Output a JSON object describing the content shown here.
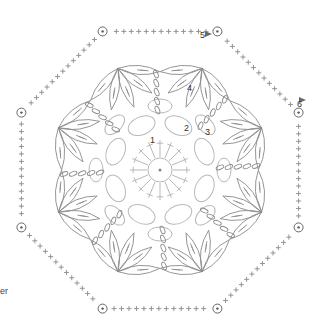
{
  "diagram": {
    "type": "crochet-chart",
    "shape": "octagon",
    "center": [
      160,
      170
    ],
    "line_colors": {
      "inner_rounds": "#b8b8b8",
      "outer_rounds": "#8a8a8a",
      "markers": "#555555",
      "arrow": "#6a6a6a"
    },
    "round_labels": [
      {
        "text": "1",
        "x": 150,
        "y": 140
      },
      {
        "text": "2",
        "x": 185,
        "y": 128
      },
      {
        "text": "3",
        "x": 206,
        "y": 132
      },
      {
        "text": "4",
        "x": 188,
        "y": 88
      },
      {
        "text": "5",
        "x": 201,
        "y": 36
      },
      {
        "text": "6",
        "x": 298,
        "y": 104
      }
    ],
    "edge_text": {
      "text": "er",
      "x": 0,
      "y": 292
    },
    "corner_count": 8,
    "petal_count": 8
  }
}
